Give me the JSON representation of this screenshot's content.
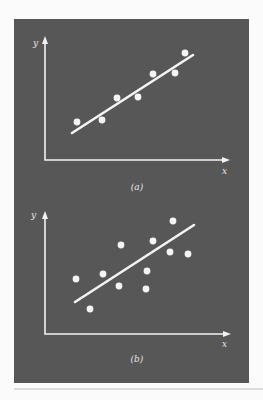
{
  "colors": {
    "page_background": "#fbfbfb",
    "panel_background": "#575757",
    "foreground": "#f4f4f4",
    "bottom_rule": "#bdbdbd"
  },
  "chart_data": [
    {
      "type": "scatter",
      "panel_caption": "(a)",
      "xlabel": "x",
      "ylabel": "y",
      "description": "Strong positive linear relationship: points lie close to the fitted line",
      "grid": false,
      "legend": null,
      "tick_labels": [],
      "points": [
        {
          "x": 77,
          "y": 122
        },
        {
          "x": 102,
          "y": 120
        },
        {
          "x": 117,
          "y": 98
        },
        {
          "x": 138,
          "y": 97
        },
        {
          "x": 153,
          "y": 74
        },
        {
          "x": 175,
          "y": 73
        },
        {
          "x": 185,
          "y": 53
        }
      ],
      "fit_line": {
        "x1": 72,
        "y1": 133,
        "x2": 193,
        "y2": 55
      },
      "axes": {
        "origin_x": 45,
        "origin_y": 160,
        "x_end": 230,
        "y_end": 36
      },
      "labels": {
        "y": {
          "x": 33,
          "y": 46
        },
        "x": {
          "x": 222,
          "y": 174
        },
        "caption": {
          "x": 137,
          "y": 190
        }
      }
    },
    {
      "type": "scatter",
      "panel_caption": "(b)",
      "xlabel": "x",
      "ylabel": "y",
      "description": "Weaker positive linear relationship: points widely scattered around the fitted line",
      "grid": false,
      "legend": null,
      "tick_labels": [],
      "points": [
        {
          "x": 76,
          "y": 279
        },
        {
          "x": 90,
          "y": 309
        },
        {
          "x": 103,
          "y": 274
        },
        {
          "x": 119,
          "y": 286
        },
        {
          "x": 121,
          "y": 245
        },
        {
          "x": 147,
          "y": 271
        },
        {
          "x": 146,
          "y": 289
        },
        {
          "x": 153,
          "y": 241
        },
        {
          "x": 170,
          "y": 252
        },
        {
          "x": 173,
          "y": 221
        },
        {
          "x": 188,
          "y": 254
        }
      ],
      "fit_line": {
        "x1": 75,
        "y1": 302,
        "x2": 194,
        "y2": 225
      },
      "axes": {
        "origin_x": 45,
        "origin_y": 334,
        "x_end": 231,
        "y_end": 211
      },
      "labels": {
        "y": {
          "x": 31,
          "y": 218
        },
        "x": {
          "x": 222,
          "y": 347
        },
        "caption": {
          "x": 137,
          "y": 362
        }
      }
    }
  ],
  "figure": {
    "panel": {
      "x": 14,
      "y": 19,
      "width": 235,
      "height": 364
    },
    "bottom_rule": {
      "x1": 14,
      "x2": 263,
      "y": 389
    }
  }
}
